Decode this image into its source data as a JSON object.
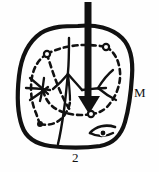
{
  "figure": {
    "figure_number": "2",
    "region_label": "M",
    "background_color": "#fefefe",
    "ink_color": "#111111",
    "outline": {
      "name": "organ-outline",
      "style": "solid",
      "stroke_width": 4
    },
    "inner_boundary": {
      "name": "dashed-inner-boundary",
      "style": "dashed",
      "stroke_width": 2.6,
      "dash_pattern": "5 4"
    },
    "nodes": [
      {
        "name": "node-upper-left",
        "x": 47,
        "y": 54
      },
      {
        "name": "node-upper-right",
        "x": 106,
        "y": 47
      },
      {
        "name": "node-lower-center",
        "x": 91,
        "y": 114
      },
      {
        "name": "node-lower-left",
        "x": 40,
        "y": 124
      },
      {
        "name": "node-bottom-right",
        "x": 102,
        "y": 132
      }
    ],
    "arrow": {
      "name": "direction-arrow",
      "direction": "down",
      "shaft_x": 88,
      "top_y": 2,
      "tip_y": 113,
      "shaft_width": 7
    },
    "veins": [
      {
        "name": "vein-center"
      },
      {
        "name": "vein-left-star"
      },
      {
        "name": "vein-right"
      },
      {
        "name": "vein-midrib"
      }
    ],
    "lens_shape": {
      "name": "lens-structure",
      "cx": 101,
      "cy": 129
    }
  }
}
